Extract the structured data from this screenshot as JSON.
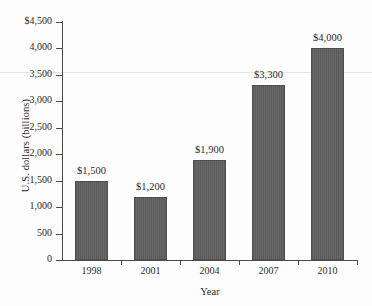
{
  "chart_data": {
    "type": "bar",
    "title": "",
    "xlabel": "Year",
    "ylabel": "U.S. dollars (billions)",
    "categories": [
      "1998",
      "2001",
      "2004",
      "2007",
      "2010"
    ],
    "values": [
      1500,
      1200,
      1900,
      3300,
      4000
    ],
    "data_labels": [
      "$1,500",
      "$1,200",
      "$1,900",
      "$3,300",
      "$4,000"
    ],
    "ylim": [
      0,
      4500
    ],
    "ytick_values": [
      0,
      500,
      1000,
      1500,
      2000,
      2500,
      3000,
      3500,
      4000,
      4500
    ],
    "ytick_labels": [
      "0",
      "500",
      "1,000",
      "1,500",
      "2,000",
      "2,500",
      "3,000",
      "3,500",
      "4,000",
      "$4,500"
    ],
    "grid": false,
    "legend": null,
    "bar_color": "#5c5c5c",
    "axis_color": "#4a4a4a",
    "background_color": "#fdfdfd"
  }
}
